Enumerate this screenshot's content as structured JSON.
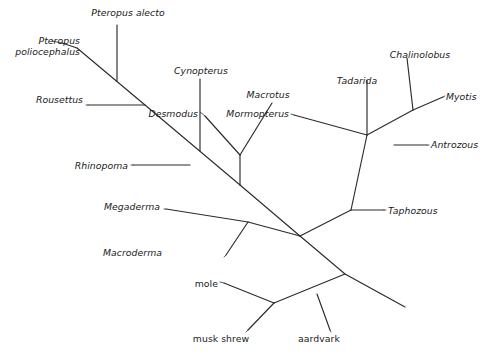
{
  "figure": {
    "kind": "phylogenetic-tree",
    "title": "",
    "background_color": "#ffffff",
    "line_color": "#2b2b2b",
    "leader_color": "#5a5a5a",
    "width": 491,
    "height": 360
  },
  "taxa": [
    {
      "id": "pteropus-poliocephalus",
      "label": "Pteropus\npoliocephalus",
      "style": "scientific",
      "align": "end",
      "x": 14,
      "y": 36,
      "w": 66
    },
    {
      "id": "pteropus-alecto",
      "label": "Pteropus alecto",
      "style": "scientific",
      "align": "mid",
      "x": 80,
      "y": 8,
      "w": 96
    },
    {
      "id": "rousettus",
      "label": "Rousettus",
      "style": "scientific",
      "align": "end",
      "x": 21,
      "y": 95,
      "w": 62
    },
    {
      "id": "cynopterus",
      "label": "Cynopterus",
      "style": "scientific",
      "align": "mid",
      "x": 165,
      "y": 66,
      "w": 72
    },
    {
      "id": "desmodus",
      "label": "Desmodus",
      "style": "scientific",
      "align": "end",
      "x": 132,
      "y": 109,
      "w": 66
    },
    {
      "id": "macrotus",
      "label": "Macrotus",
      "style": "scientific",
      "align": "mid",
      "x": 237,
      "y": 90,
      "w": 62
    },
    {
      "id": "rhinopoma",
      "label": "Rhinopoma",
      "style": "scientific",
      "align": "end",
      "x": 56,
      "y": 161,
      "w": 72
    },
    {
      "id": "megaderma",
      "label": "Megaderma",
      "style": "scientific",
      "align": "end",
      "x": 82,
      "y": 202,
      "w": 78
    },
    {
      "id": "macroderma",
      "label": "Macroderma",
      "style": "scientific",
      "align": "end",
      "x": 82,
      "y": 248,
      "w": 80
    },
    {
      "id": "mormopterus",
      "label": "Mormopterus",
      "style": "scientific",
      "align": "end",
      "x": 207,
      "y": 109,
      "w": 82
    },
    {
      "id": "tadarida",
      "label": "Tadarida",
      "style": "scientific",
      "align": "mid",
      "x": 327,
      "y": 76,
      "w": 60
    },
    {
      "id": "chalinolobus",
      "label": "Chalinolobus",
      "style": "scientific",
      "align": "mid",
      "x": 380,
      "y": 50,
      "w": 80
    },
    {
      "id": "myotis",
      "label": "Myotis",
      "style": "scientific",
      "align": "start",
      "x": 446,
      "y": 92,
      "w": 44
    },
    {
      "id": "antrozous",
      "label": "Antrozous",
      "style": "scientific",
      "align": "start",
      "x": 431,
      "y": 140,
      "w": 60
    },
    {
      "id": "taphozous",
      "label": "Taphozous",
      "style": "scientific",
      "align": "start",
      "x": 388,
      "y": 206,
      "w": 64
    },
    {
      "id": "mole",
      "label": "mole",
      "style": "common",
      "align": "end",
      "x": 180,
      "y": 279,
      "w": 38
    },
    {
      "id": "musk-shrew",
      "label": "musk shrew",
      "style": "common",
      "align": "mid",
      "x": 186,
      "y": 334,
      "w": 70
    },
    {
      "id": "aardvark",
      "label": "aardvark",
      "style": "common",
      "align": "mid",
      "x": 290,
      "y": 334,
      "w": 58
    }
  ],
  "branches": [
    {
      "id": "backbone-upper",
      "points": "77,48 145,105 240,185 300,236"
    },
    {
      "id": "backbone-lower",
      "points": "300,236 345,274 405,307"
    },
    {
      "id": "tip-pteropus-poliocephalus",
      "points": "77,48 62,43"
    },
    {
      "id": "tip-pteropus-alecto",
      "points": "117,81 117,25"
    },
    {
      "id": "tip-rousettus",
      "points": "145,105 88,105"
    },
    {
      "id": "tip-cynopterus",
      "points": "200,151 200,79"
    },
    {
      "id": "node-desmodus-macrotus-stem",
      "points": "240,185 240,155"
    },
    {
      "id": "tip-desmodus",
      "points": "240,155 205,116"
    },
    {
      "id": "tip-macrotus",
      "points": "240,155 272,103"
    },
    {
      "id": "tip-rhinopoma",
      "points": "190,165 133,165"
    },
    {
      "id": "node-megadermatidae-stem",
      "points": "300,236 248,222"
    },
    {
      "id": "tip-megaderma",
      "points": "248,222 166,209"
    },
    {
      "id": "tip-macroderma",
      "points": "248,222 226,255"
    },
    {
      "id": "node-yangochiroptera-stem",
      "points": "300,236 351,210"
    },
    {
      "id": "node-molossid-vesper-stem",
      "points": "351,210 367,135"
    },
    {
      "id": "tip-taphozous",
      "points": "351,210 384,210"
    },
    {
      "id": "node-tadarida-mormopterus",
      "points": "367,135 367,80"
    },
    {
      "id": "tip-mormopterus",
      "points": "367,135 294,115"
    },
    {
      "id": "node-vespertilionid-stem",
      "points": "367,135 413,110"
    },
    {
      "id": "tip-antrozous",
      "points": "394,145 427,145"
    },
    {
      "id": "tip-chalinolobus",
      "points": "413,110 407,58"
    },
    {
      "id": "tip-myotis",
      "points": "413,110 443,97"
    },
    {
      "id": "node-outgroup-stem",
      "points": "345,274 274,303"
    },
    {
      "id": "tip-aardvark",
      "points": "317,294 330,330"
    },
    {
      "id": "tip-mole",
      "points": "274,303 224,283"
    },
    {
      "id": "tip-musk-shrew",
      "points": "274,303 248,330"
    }
  ],
  "leaders": [
    {
      "id": "leader-pteropus-poliocephalus",
      "points": "62,43 52,41"
    },
    {
      "id": "leader-rousettus",
      "points": "88,105 86,105"
    },
    {
      "id": "leader-desmodus",
      "points": "205,116 200,112"
    },
    {
      "id": "leader-rhinopoma",
      "points": "133,165 131,165"
    },
    {
      "id": "leader-megaderma",
      "points": "166,209 164,209"
    },
    {
      "id": "leader-macroderma",
      "points": "226,255 224,257"
    },
    {
      "id": "leader-mormopterus",
      "points": "294,115 291,114"
    },
    {
      "id": "leader-myotis",
      "points": "443,97 445,96"
    },
    {
      "id": "leader-antrozous",
      "points": "427,145 429,145"
    },
    {
      "id": "leader-taphozous",
      "points": "384,210 386,210"
    },
    {
      "id": "leader-mole",
      "points": "224,283 220,282"
    },
    {
      "id": "leader-musk-shrew",
      "points": "248,330 246,332"
    },
    {
      "id": "leader-aardvark",
      "points": "330,330 331,332"
    }
  ],
  "chart_data": {
    "type": "tree",
    "layout": "unrooted-slanted-cladogram",
    "title": "",
    "tip_count": 18,
    "tips": [
      "Pteropus poliocephalus",
      "Pteropus alecto",
      "Rousettus",
      "Cynopterus",
      "Desmodus",
      "Macrotus",
      "Rhinopoma",
      "Megaderma",
      "Macroderma",
      "Mormopterus",
      "Tadarida",
      "Chalinolobus",
      "Myotis",
      "Antrozous",
      "Taphozous",
      "mole",
      "musk shrew",
      "aardvark"
    ],
    "ingroup_tips": [
      "Pteropus poliocephalus",
      "Pteropus alecto",
      "Rousettus",
      "Cynopterus",
      "Desmodus",
      "Macrotus",
      "Rhinopoma",
      "Megaderma",
      "Macroderma",
      "Mormopterus",
      "Tadarida",
      "Chalinolobus",
      "Myotis",
      "Antrozous",
      "Taphozous"
    ],
    "outgroup_tips": [
      "mole",
      "musk shrew",
      "aardvark"
    ],
    "clades": [
      {
        "name": "Pteropus",
        "members": [
          "Pteropus poliocephalus",
          "Pteropus alecto"
        ]
      },
      {
        "name": "Phyllostomid-node",
        "members": [
          "Desmodus",
          "Macrotus"
        ]
      },
      {
        "name": "Megadermatidae",
        "members": [
          "Megaderma",
          "Macroderma"
        ]
      },
      {
        "name": "Molossidae",
        "members": [
          "Mormopterus",
          "Tadarida"
        ]
      },
      {
        "name": "Vespertilionidae",
        "members": [
          "Chalinolobus",
          "Myotis"
        ]
      },
      {
        "name": "Outgroup",
        "members": [
          "mole",
          "musk shrew",
          "aardvark"
        ]
      }
    ],
    "label_styles": {
      "scientific": "italic",
      "common": "roman"
    },
    "branch_lengths_shown": false,
    "scale_bar": false,
    "support_values": false
  }
}
